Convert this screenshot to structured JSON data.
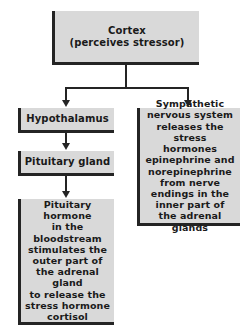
{
  "diagram": {
    "colors": {
      "box_fill": "#d9d9d9",
      "box_border": "#242424",
      "text": "#1a1a1a",
      "background": "#ffffff",
      "connector": "#242424"
    },
    "nodes": [
      {
        "id": "cortex",
        "text": "Cortex\n(perceives stressor)",
        "role": "root"
      },
      {
        "id": "hypothalamus",
        "text": "Hypothalamus",
        "role": "branch-left"
      },
      {
        "id": "pituitary_gland",
        "text": "Pituitary gland",
        "role": "branch-left"
      },
      {
        "id": "pituitary_hormone",
        "text": "Pituitary hormone\nin the bloodstream\nstimulates the\nouter part of\nthe adrenal gland\nto release the\nstress hormone\ncortisol",
        "role": "branch-left"
      },
      {
        "id": "sympathetic",
        "text": "Sympathetic\nnervous system\nreleases the stress\nhormones\nepinephrine and\nnorepinephrine\nfrom nerve\nendings in the\ninner part of\nthe adrenal glands",
        "role": "branch-right"
      }
    ],
    "edges": [
      {
        "from": "cortex",
        "to": "hypothalamus",
        "style": "arrow"
      },
      {
        "from": "cortex",
        "to": "sympathetic",
        "style": "arrow"
      },
      {
        "from": "hypothalamus",
        "to": "pituitary_gland",
        "style": "arrow"
      },
      {
        "from": "pituitary_gland",
        "to": "pituitary_hormone",
        "style": "arrow"
      }
    ]
  }
}
